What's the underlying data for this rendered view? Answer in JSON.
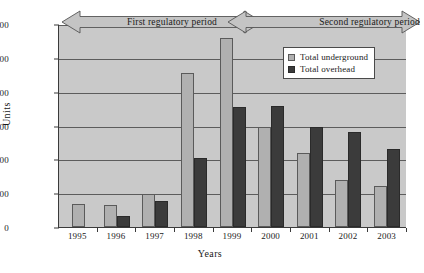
{
  "chart_data": {
    "type": "bar",
    "title": "",
    "xlabel": "Years",
    "ylabel": "Units",
    "ylim": [
      0,
      3000
    ],
    "ytick_step": 500,
    "yticks": [
      0,
      500,
      1000,
      1500,
      2000,
      2500,
      3000
    ],
    "grid": true,
    "legend_position": "upper right",
    "categories": [
      "1995",
      "1996",
      "1997",
      "1998",
      "1999",
      "2000",
      "2001",
      "2002",
      "2003"
    ],
    "series": [
      {
        "name": "Total underground",
        "color": "#b0b0b0",
        "values": [
          340,
          330,
          495,
          2270,
          2790,
          1475,
          1090,
          700,
          605
        ]
      },
      {
        "name": "Total overhead",
        "color": "#3b3b3b",
        "values": [
          0,
          165,
          390,
          1025,
          1780,
          1790,
          1480,
          1410,
          1160
        ]
      }
    ],
    "annotations": [
      {
        "text": "First regulatory period",
        "kind": "double-arrow-banner",
        "spans": [
          "1995",
          "1999"
        ]
      },
      {
        "text": "Second regulatory period",
        "kind": "double-arrow-banner",
        "spans": [
          "1999",
          "2003"
        ]
      }
    ]
  },
  "axes": {
    "ylabel": "Units",
    "xlabel": "Years",
    "ytick_labels": [
      "3000",
      "2500",
      "2000",
      "1500",
      "1000",
      "500",
      "0"
    ],
    "xtick_labels": [
      "1995",
      "1996",
      "1997",
      "1998",
      "1999",
      "2000",
      "2001",
      "2002",
      "2003"
    ]
  },
  "legend": {
    "items": [
      {
        "label": "Total underground",
        "swatch": "ug"
      },
      {
        "label": "Total overhead",
        "swatch": "oh"
      }
    ]
  },
  "banners": {
    "first": "First regulatory period",
    "second": "Second regulatory period"
  },
  "colors": {
    "plot_background": "#c9c9c9",
    "underground": "#b0b0b0",
    "overhead": "#3b3b3b",
    "gridline": "#5c5c5c",
    "axis": "#3a3a3a",
    "banner_fill": "#c4c4c4",
    "legend_background": "#ffffff"
  }
}
